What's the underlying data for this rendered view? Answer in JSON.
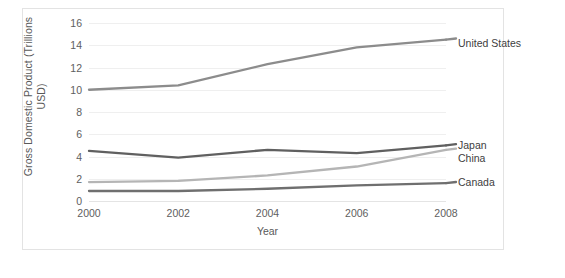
{
  "chart_data": {
    "type": "line",
    "title": "",
    "xlabel": "Year",
    "ylabel": "Gross Domestic Product (Trillions USD)",
    "ylabel_line1": "Gross Domestic Product (Trillions",
    "ylabel_line2": "USD)",
    "x": [
      2000,
      2002,
      2004,
      2006,
      2008
    ],
    "categories": [
      "2000",
      "2002",
      "2004",
      "2006",
      "2008"
    ],
    "xlim": [
      2000,
      2008
    ],
    "ylim": [
      0,
      16
    ],
    "yticks": [
      0,
      2,
      4,
      6,
      8,
      10,
      12,
      14,
      16
    ],
    "ytick_labels": [
      "0",
      "2",
      "4",
      "6",
      "8",
      "10",
      "12",
      "14",
      "16"
    ],
    "grid": true,
    "grid_axis": "y",
    "legend_position": "right-inline-end-of-line",
    "series": [
      {
        "name": "United States",
        "values": [
          10.0,
          10.4,
          12.3,
          13.8,
          14.5
        ],
        "color": "#8c8c8c"
      },
      {
        "name": "Japan",
        "values": [
          4.5,
          3.9,
          4.6,
          4.3,
          5.0
        ],
        "color": "#606060"
      },
      {
        "name": "China",
        "values": [
          1.7,
          1.8,
          2.3,
          3.1,
          4.6
        ],
        "color": "#b5b5b5"
      },
      {
        "name": "Canada",
        "values": [
          0.9,
          0.9,
          1.1,
          1.4,
          1.6
        ],
        "color": "#6f6f6f"
      }
    ]
  },
  "axis": {
    "ytick_0": "0",
    "ytick_1": "2",
    "ytick_2": "4",
    "ytick_3": "6",
    "ytick_4": "8",
    "ytick_5": "10",
    "ytick_6": "12",
    "ytick_7": "14",
    "ytick_8": "16",
    "xtick_0": "2000",
    "xtick_1": "2002",
    "xtick_2": "2004",
    "xtick_3": "2006",
    "xtick_4": "2008"
  },
  "legend": {
    "united_states": "United States",
    "japan": "Japan",
    "china": "China",
    "canada": "Canada"
  }
}
